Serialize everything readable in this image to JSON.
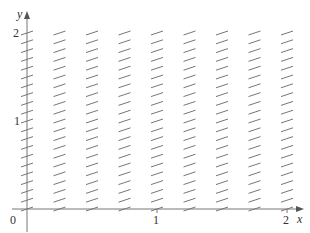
{
  "chart_data": {
    "type": "slope_field",
    "title": "",
    "xlabel": "x",
    "ylabel": "y",
    "xlim": [
      0,
      2
    ],
    "ylim": [
      0,
      2
    ],
    "x_ticks": [
      {
        "value": 1,
        "label": "1"
      },
      {
        "value": 2,
        "label": "2"
      }
    ],
    "y_ticks": [
      {
        "value": 1,
        "label": "1"
      },
      {
        "value": 2,
        "label": "2"
      }
    ],
    "origin_label": "0",
    "grid": false,
    "field": {
      "x_values": [
        0,
        0.25,
        0.5,
        0.75,
        1,
        1.25,
        1.5,
        1.75,
        2
      ],
      "y_step": 0.1,
      "y_min": 0,
      "y_max": 2,
      "segment_slope_pixels": 0.33,
      "note": "Short line segments of nearly constant gentle positive slope at every grid point"
    }
  },
  "axes": {
    "x_label": "x",
    "y_label": "y",
    "origin": "0",
    "x_tick_labels": [
      "1",
      "2"
    ],
    "y_tick_labels": [
      "1",
      "2"
    ]
  },
  "colors": {
    "axis": "#555555",
    "segment": "#666666",
    "text": "#333333"
  }
}
